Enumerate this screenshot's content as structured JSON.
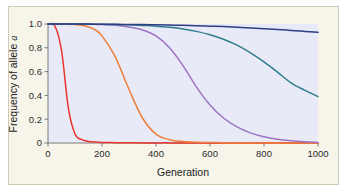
{
  "figure": {
    "background_color": "#f7f5ea",
    "plot_background_color": "#e8eaf7",
    "frame_color": "#cfcbb9"
  },
  "chart_data": {
    "type": "line",
    "title": "",
    "xlabel": "Generation",
    "ylabel": "Frequency of allele a",
    "ylabel_text": "Frequency of allele ",
    "ylabel_italic": "a",
    "xlim": [
      0,
      1000
    ],
    "ylim": [
      0,
      1.0
    ],
    "grid": false,
    "legend": "none",
    "xticks": [
      0,
      200,
      400,
      600,
      800,
      1000
    ],
    "xtick_labels": [
      "0",
      "200",
      "400",
      "600",
      "800",
      "1000"
    ],
    "yticks": [
      0,
      0.2,
      0.4,
      0.6,
      0.8,
      1.0
    ],
    "ytick_labels": [
      "0",
      "0.2",
      "0.4",
      "0.6",
      "0.8",
      "1.0"
    ],
    "x": [
      0,
      25,
      50,
      75,
      100,
      125,
      150,
      175,
      200,
      250,
      300,
      350,
      400,
      450,
      500,
      550,
      600,
      650,
      700,
      750,
      800,
      850,
      900,
      950,
      1000
    ],
    "series": [
      {
        "name": "red-curve",
        "color": "#e8342a",
        "values": [
          1.0,
          0.985,
          0.78,
          0.3,
          0.075,
          0.028,
          0.013,
          0.008,
          0.005,
          0.003,
          0.002,
          0.001,
          0.001,
          0.001,
          0.0,
          0.0,
          0.0,
          0.0,
          0.0,
          0.0,
          0.0,
          0.0,
          0.0,
          0.0,
          0.0
        ]
      },
      {
        "name": "orange-curve",
        "color": "#ef7e3b",
        "values": [
          1.0,
          1.0,
          0.999,
          0.998,
          0.995,
          0.99,
          0.975,
          0.95,
          0.9,
          0.72,
          0.45,
          0.21,
          0.075,
          0.028,
          0.012,
          0.006,
          0.004,
          0.002,
          0.001,
          0.001,
          0.0,
          0.0,
          0.0,
          0.0,
          0.0
        ]
      },
      {
        "name": "purple-curve",
        "color": "#9b74c4",
        "values": [
          1.0,
          1.0,
          1.0,
          1.0,
          0.999,
          0.999,
          0.998,
          0.997,
          0.995,
          0.99,
          0.975,
          0.95,
          0.9,
          0.8,
          0.65,
          0.47,
          0.32,
          0.21,
          0.135,
          0.085,
          0.052,
          0.031,
          0.018,
          0.01,
          0.005
        ]
      },
      {
        "name": "teal-curve",
        "color": "#2f7d8c",
        "values": [
          1.0,
          1.0,
          1.0,
          1.0,
          1.0,
          0.999,
          0.999,
          0.998,
          0.998,
          0.996,
          0.993,
          0.988,
          0.982,
          0.972,
          0.958,
          0.938,
          0.91,
          0.872,
          0.822,
          0.758,
          0.682,
          0.596,
          0.506,
          0.444,
          0.39
        ]
      },
      {
        "name": "navy-curve",
        "color": "#2c3f82",
        "values": [
          1.0,
          1.0,
          1.0,
          1.0,
          0.999,
          0.999,
          0.999,
          0.998,
          0.998,
          0.997,
          0.996,
          0.995,
          0.993,
          0.991,
          0.989,
          0.986,
          0.982,
          0.978,
          0.973,
          0.967,
          0.961,
          0.954,
          0.946,
          0.938,
          0.93
        ]
      }
    ]
  }
}
